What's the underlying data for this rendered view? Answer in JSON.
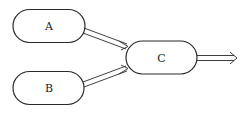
{
  "diagram": {
    "nodes": [
      {
        "id": "A",
        "label": "A"
      },
      {
        "id": "B",
        "label": "B"
      },
      {
        "id": "C",
        "label": "C"
      }
    ],
    "edges": [
      {
        "from": "A",
        "to": "C",
        "style": "double-line-arrow"
      },
      {
        "from": "B",
        "to": "C",
        "style": "double-line-arrow"
      },
      {
        "from": "C",
        "to": "output",
        "style": "double-line-arrow"
      }
    ],
    "colors": {
      "stroke": "#2a2a2a",
      "background": "#ffffff"
    }
  }
}
